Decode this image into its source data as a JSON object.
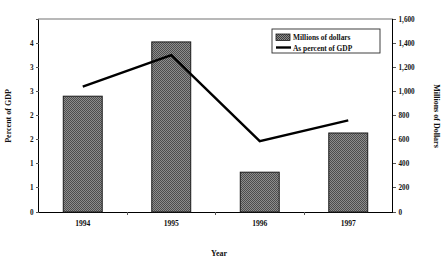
{
  "chart_data": {
    "type": "bar",
    "title": "",
    "subtitle": "",
    "xlabel": "Year",
    "ylabel": "Percent of GDP",
    "y2label": "Millions of Dollars",
    "categories": [
      "1994",
      "1995",
      "1996",
      "1997"
    ],
    "grid": false,
    "legend_position": "top-right",
    "ylim": [
      0,
      4
    ],
    "y2lim": [
      0,
      1600
    ],
    "yticks": [
      0,
      0.5,
      1,
      1.5,
      2,
      2.5,
      3,
      3.5,
      4
    ],
    "ytick_labels": [
      "0",
      "1",
      "1",
      "2",
      "2",
      "3",
      "3",
      "4"
    ],
    "ytick_labels_shown": [
      "0",
      "1",
      "1",
      "2",
      "2",
      "3",
      "3",
      "4"
    ],
    "y2ticks": [
      0,
      200,
      400,
      600,
      800,
      1000,
      1200,
      1400,
      1600
    ],
    "y2tick_labels": [
      "0",
      "200",
      "400",
      "600",
      "800",
      "1,000",
      "1,200",
      "1,400",
      "1,600"
    ],
    "series": [
      {
        "name": "Millions of dollars",
        "type": "bar",
        "axis": "right",
        "values": [
          960,
          1410,
          330,
          655
        ],
        "color": "#7a7a7a",
        "edge_color": "#1a1a1a"
      },
      {
        "name": "As percent of GDP",
        "type": "line",
        "axis": "left",
        "values": [
          2.6,
          3.25,
          1.47,
          1.9
        ],
        "color": "#000000"
      }
    ]
  },
  "legend": {
    "entries": [
      {
        "label": "Millions of dollars",
        "marker": "hatched-swatch"
      },
      {
        "label": "As percent of GDP",
        "marker": "line-swatch"
      }
    ]
  },
  "axes": {
    "left_title": "Percent of GDP",
    "right_title": "Millions of Dollars",
    "bottom_title": "Year"
  },
  "colors": {
    "bar_fill": "#7a7a7a",
    "bar_edge": "#1a1a1a",
    "line": "#000000",
    "axis": "#000000",
    "background": "#ffffff"
  }
}
